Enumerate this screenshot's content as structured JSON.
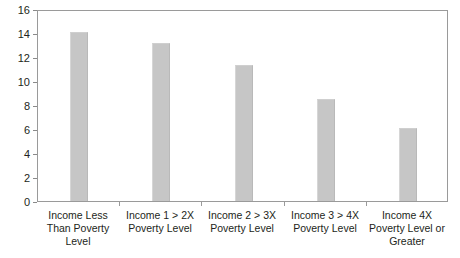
{
  "chart_data": {
    "type": "bar",
    "title": "",
    "subtitle": "",
    "xlabel": "",
    "ylabel": "",
    "ylim": [
      0,
      16
    ],
    "y_ticks": [
      0,
      2,
      4,
      6,
      8,
      10,
      12,
      14,
      16
    ],
    "grid": false,
    "legend": false,
    "legend_position": "none",
    "bar_color": "#c6c6c6",
    "axis_color": "#9a9a9a",
    "text_color": "#231f20",
    "categories": [
      "Income Less Than Poverty Level",
      "Income 1 > 2X Poverty Level",
      "Income 2 > 3X Poverty Level",
      "Income 3 > 4X Poverty Level",
      "Income 4X Poverty Level or Greater"
    ],
    "category_lines": [
      [
        "Income Less",
        "Than Poverty",
        "Level"
      ],
      [
        "Income 1 > 2X",
        "Poverty Level"
      ],
      [
        "Income 2 > 3X",
        "Poverty Level"
      ],
      [
        "Income 3 > 4X",
        "Poverty Level"
      ],
      [
        "Income 4X",
        "Poverty Level or",
        "Greater"
      ]
    ],
    "values": [
      14.1,
      13.2,
      11.3,
      8.5,
      6.1
    ]
  }
}
